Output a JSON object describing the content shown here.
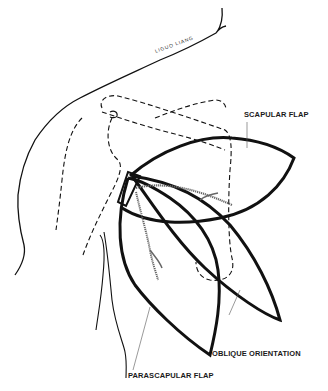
{
  "figure": {
    "type": "anatomical line drawing",
    "labels": {
      "scapular_flap": "SCAPULAR FLAP",
      "oblique_orientation": "OBLIQUE ORIENTATION",
      "parascapular_flap": "PARASCAPULAR FLAP",
      "handwritten": "LIGUO LIANG"
    },
    "colors": {
      "ink": "#111111",
      "leader": "#555555",
      "background": "#ffffff"
    }
  }
}
